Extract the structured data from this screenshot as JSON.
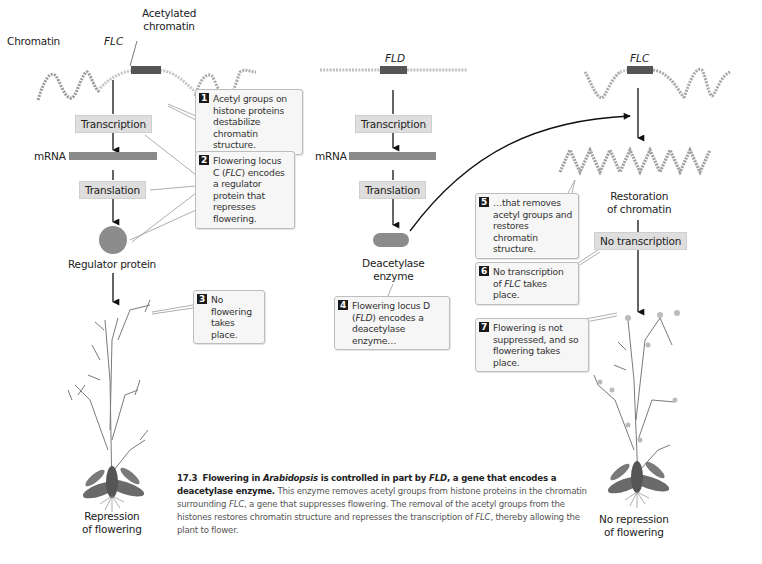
{
  "figure": {
    "left_panel": {
      "chromatin_label": "Chromatin",
      "gene_label": "FLC",
      "acetylated_label_line1": "Acetylated",
      "acetylated_label_line2": "chromatin",
      "step_transcription": "Transcription",
      "mrna_label": "mRNA",
      "step_translation": "Translation",
      "product_label": "Regulator protein",
      "outcome_line1": "Repression",
      "outcome_line2": "of flowering"
    },
    "middle_panel": {
      "gene_label": "FLD",
      "step_transcription": "Transcription",
      "mrna_label": "mRNA",
      "step_translation": "Translation",
      "product_line1": "Deacetylase",
      "product_line2": "enzyme"
    },
    "right_panel": {
      "gene_label": "FLC",
      "restoration_line1": "Restoration",
      "restoration_line2": "of chromatin",
      "step_no_transcription": "No transcription",
      "outcome_line1": "No repression",
      "outcome_line2": "of flowering"
    },
    "callouts": [
      {
        "num": "1",
        "text": "Acetyl groups on histone proteins destabilize chromatin structure."
      },
      {
        "num": "2",
        "pre": "Flowering locus C (",
        "italic": "FLC",
        "post": ") encodes a regulator protein that represses flowering."
      },
      {
        "num": "3",
        "text": "No flowering takes place."
      },
      {
        "num": "4",
        "pre": "Flowering locus D (",
        "italic": "FLD",
        "post": ") encodes a deacetylase enzyme…"
      },
      {
        "num": "5",
        "text": "…that removes acetyl groups and restores chromatin structure."
      },
      {
        "num": "6",
        "pre": "No transcription of ",
        "italic": "FLC",
        "post": " takes place."
      },
      {
        "num": "7",
        "text": "Flowering is not suppressed, and so flowering takes place."
      }
    ],
    "caption": {
      "number": "17.3",
      "bold_a": "Flowering in ",
      "bold_italic_a": "Arabidopsis",
      "bold_b": " is controlled in part by ",
      "bold_italic_b": "FLD",
      "bold_c": ", a gene that encodes a deacetylase enzyme.",
      "body_a": " This enzyme removes acetyl groups from histone proteins in the chromatin surrounding ",
      "body_italic_a": "FLC",
      "body_b": ", a gene that suppresses flowering. The removal of the acetyl groups from the histones restores chromatin structure and represses the transcription of ",
      "body_italic_b": "FLC",
      "body_c": ", thereby allowing the plant to flower."
    },
    "colors": {
      "step_box": "#dedede",
      "callout_box": "#f6f6f6",
      "mrna_bar": "#8a8a8a",
      "protein": "#8c8c8c",
      "gene_segment": "#555555",
      "number_badge": "#1a1a1a"
    }
  }
}
